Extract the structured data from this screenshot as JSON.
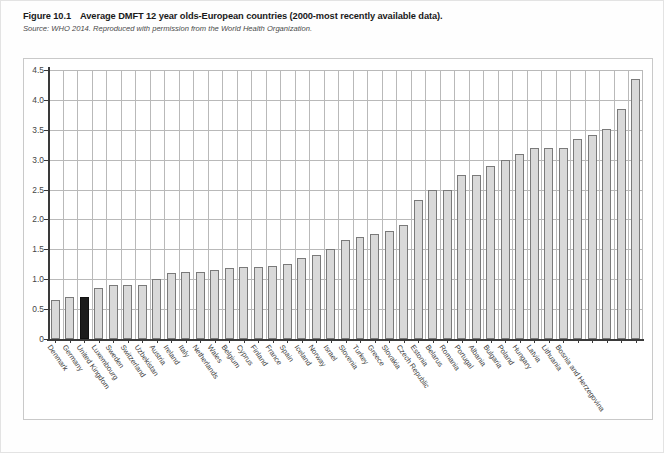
{
  "caption": {
    "figure_number": "Figure 10.1",
    "title": "Average DMFT 12 year olds-European countries (2000-most recently available data).",
    "source": "Source: WHO 2014. Reproduced with permission from the World Health Organization."
  },
  "colors": {
    "bar_fill": "#d9d9d9",
    "bar_stroke": "#7a7a7a",
    "highlight_fill": "#1c1c1c",
    "axis": "#3a3a3a",
    "grid": "#b9b9b9"
  },
  "chart_data": {
    "type": "bar",
    "title": "Average DMFT 12 year olds-European countries (2000-most recently available data).",
    "xlabel": "",
    "ylabel": "",
    "ylim": [
      0,
      4.5
    ],
    "yticks": [
      "0",
      "0.5",
      "1.0",
      "1.5",
      "2.0",
      "2.5",
      "3.0",
      "3.5",
      "4.0",
      "4.5"
    ],
    "ytick_values": [
      0,
      0.5,
      1.0,
      1.5,
      2.0,
      2.5,
      3.0,
      3.5,
      4.0,
      4.5
    ],
    "grid": true,
    "legend": null,
    "highlight_category": "United Kingdom",
    "categories": [
      "Denmark",
      "Germany",
      "United Kingdom",
      "Luxembourg",
      "Sweden",
      "Switzerland",
      "Uzbekistan",
      "Austria",
      "Ireland",
      "Italy",
      "Netherlands",
      "Wales",
      "Belgium",
      "Cyprus",
      "Finland",
      "France",
      "Spain",
      "Iceland",
      "Norway",
      "Israel",
      "Slovenia",
      "Turkey",
      "Greece",
      "Slovakia",
      "Czech Republic",
      "Estonia",
      "Belarus",
      "Romania",
      "Portugal",
      "Albania",
      "Bulgaria",
      "Poland",
      "Hungary",
      "Latvia",
      "Lithuania",
      "Bosnia and Herzegovina"
    ],
    "values": [
      0.65,
      0.7,
      0.7,
      0.85,
      0.9,
      0.9,
      0.9,
      1.0,
      1.1,
      1.12,
      1.12,
      1.15,
      1.18,
      1.2,
      1.2,
      1.22,
      1.25,
      1.35,
      1.4,
      1.5,
      1.65,
      1.7,
      1.75,
      1.8,
      1.9,
      2.33,
      2.5,
      2.5,
      2.75,
      2.75,
      2.9,
      3.0,
      3.1,
      3.2,
      3.2,
      3.2
    ],
    "values_tail": [
      3.35,
      3.42,
      3.52,
      3.85,
      4.35
    ]
  }
}
